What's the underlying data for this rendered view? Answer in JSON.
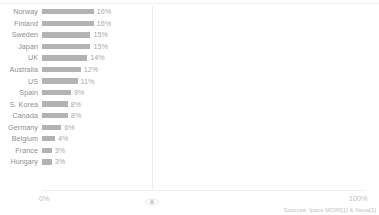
{
  "chart_data": {
    "type": "bar",
    "orientation": "horizontal",
    "title": "",
    "xlabel": "",
    "ylabel": "",
    "xlim": [
      0,
      100
    ],
    "grid": true,
    "legend": null,
    "categories": [
      "Norway",
      "Finland",
      "Sweden",
      "Japan",
      "UK",
      "Australia",
      "US",
      "Spain",
      "S. Korea",
      "Canada",
      "Germany",
      "Belgium",
      "France",
      "Hungary"
    ],
    "values": [
      16,
      16,
      15,
      15,
      14,
      12,
      11,
      9,
      8,
      8,
      6,
      4,
      3,
      3
    ],
    "value_labels": [
      "16%",
      "16%",
      "15%",
      "15%",
      "14%",
      "12%",
      "11%",
      "9%",
      "8%",
      "8%",
      "6%",
      "4%",
      "3%",
      "3%"
    ],
    "bar_color": "#b3b3b3",
    "background": "#ffffff"
  },
  "axis": {
    "ticks": [
      {
        "label": "0%",
        "value": 0
      },
      {
        "label": "100%",
        "value": 100
      }
    ],
    "gridline_value": 34,
    "marker_icon": "eye-icon"
  },
  "footer": {
    "source": "Sources: Ipsos MORI[1] & Nova[1]"
  }
}
